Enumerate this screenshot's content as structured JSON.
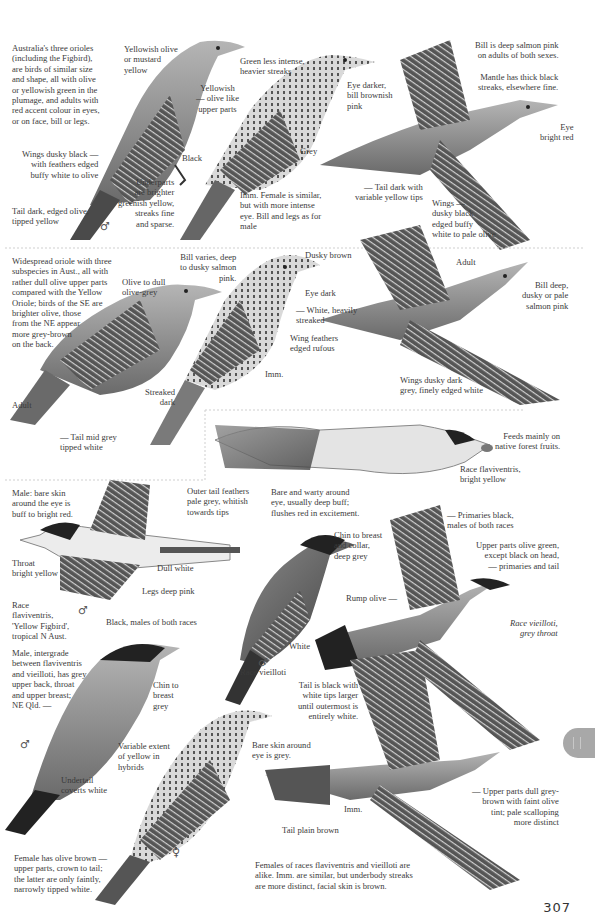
{
  "page": {
    "number": "307",
    "accent_tab_color": "#a8a8a8"
  },
  "section1": {
    "intro": "Australia's three orioles\n(including the Figbird),\nare birds of similar size\nand shape, all with olive\nor yellowish green in the\nplumage, and adults with\nred accent colour in eyes,\nor on face, bill or legs.",
    "male_labels": {
      "crown": "Yellowish olive\nor mustard\nyellow",
      "upper": "Yellowish\n— olive like\nupper parts",
      "legs": "Black",
      "wings": "Wings dusky black —\nwith feathers edged\nbuffy white to olive",
      "under": "Underparts\nare brighter\ngreenish yellow,\nstreaks fine\nand sparse.",
      "tail": "Tail dark, edged olive,\ntipped yellow",
      "sex": "♂"
    },
    "imm_labels": {
      "green": "Green less intense,\nheavier streaks",
      "eye": "Eye darker,\nbill brownish\npink",
      "legs": "Grey",
      "note": "Imm. Female is similar,\nbut with more intense\neye. Bill and legs as for\nmale"
    },
    "flight_labels": {
      "bill": "Bill is deep salmon pink\non adults of both sexes.",
      "mantle": "Mantle has thick black\nstreaks, elsewhere fine.",
      "eye": "Eye\nbright red",
      "tail": "— Tail dark with\nvariable yellow tips",
      "wings": "Wings —\ndusky black\nedged buffy\nwhite to pale olive"
    }
  },
  "section2": {
    "intro": "Widespread oriole with three\nsubspecies in Aust., all with\nrather dull olive upper parts\ncompared with the Yellow\nOriole; birds of the SE are\nbrighter olive, those\nfrom the NE appear\nmore grey-brown\non the back.",
    "adult_labels": {
      "head": "Olive to dull\nolive-grey",
      "bill": "Bill varies, deep\nto dusky salmon\npink.",
      "streak": "Streaked\ndark",
      "age": "Adult",
      "tail": "— Tail mid grey\ntipped white"
    },
    "imm_labels": {
      "crown": "Dusky brown",
      "eye": "Eye dark",
      "under": "— White, heavily\nstreaked",
      "wing": "Wing feathers\nedged rufous",
      "age": "Imm."
    },
    "flight_labels": {
      "age": "Adult",
      "bill": "Bill deep,\ndusky or pale\nsalmon pink",
      "wings": "Wings dusky dark\ngrey, finely edged white"
    }
  },
  "section3": {
    "fruit_label": "Feeds mainly on\nnative forest fruits.",
    "race_flav": "Race flaviventris,\nbright yellow",
    "outer_tail": "Outer tail feathers\npale grey, whitish\ntowards tips",
    "bare_warty": "Bare and warty around\neye, usually deep buff;\nflushes red in excitement.",
    "male_skin": "Male: bare skin\naround the eye is\nbuff to bright red.",
    "throat": "Throat\nbright yellow",
    "dull_white": "Dull white",
    "legs": "Legs deep pink",
    "race_note": "Race\nflaviventris,\n'Yellow Figbird',\ntropical N Aust.",
    "sex_male": "♂",
    "black_males": "Black, males of both races",
    "chin_breast_collar": "Chin to breast\nand collar,\ndeep grey",
    "primaries": "— Primaries black,\nmales of both races",
    "upper_olive": "Upper parts olive green,\nexcept black on head,\n— primaries and tail",
    "rump": "Rump olive —",
    "race_vieilloti_grey": "Race vieilloti,\ngrey throat",
    "white": "White",
    "race_vieilloti": "Race vieilloti",
    "tail_black": "Tail is black with\nwhite tips larger\nuntil outermost is\nentirely white.",
    "intergrade": "Male, intergrade\nbetween flaviventris\nand vieilloti, has grey\nupper back, throat\nand upper breast;\nNE Qld. —",
    "chin_grey": "Chin to\nbreast\ngrey",
    "variable_yellow": "Variable extent\nof yellow in\nhybrids",
    "undertail": "Undertail\ncoverts white",
    "bare_grey": "Bare skin around\neye is grey.",
    "upper_grey_brown": "— Upper parts dull grey-\nbrown with faint olive\ntint; pale scalloping\nmore distinct",
    "imm": "Imm.",
    "tail_plain": "Tail plain brown",
    "female_note": "Female has olive brown —\nupper parts, crown to tail;\nthe latter are only faintly,\nnarrowly tipped white.",
    "females_races": "Females of races flaviventris and vieilloti are\nalike.  Imm. are similar, but underbody streaks\nare more distinct, facial skin is brown.",
    "sex_female": "♀"
  }
}
